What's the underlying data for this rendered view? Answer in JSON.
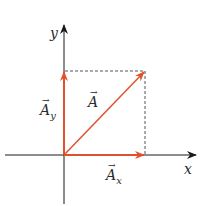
{
  "diagram": {
    "type": "vector-components",
    "colors": {
      "vector": "#e0522a",
      "axis": "#1a1a1a",
      "dashed": "#555555"
    },
    "axes": {
      "x_label": "x",
      "y_label": "y"
    },
    "vectors": [
      {
        "name": "A",
        "label": "A",
        "subscript": ""
      },
      {
        "name": "A_x",
        "label": "A",
        "subscript": "x"
      },
      {
        "name": "A_y",
        "label": "A",
        "subscript": "y"
      }
    ],
    "arrow_glyph": "→"
  }
}
